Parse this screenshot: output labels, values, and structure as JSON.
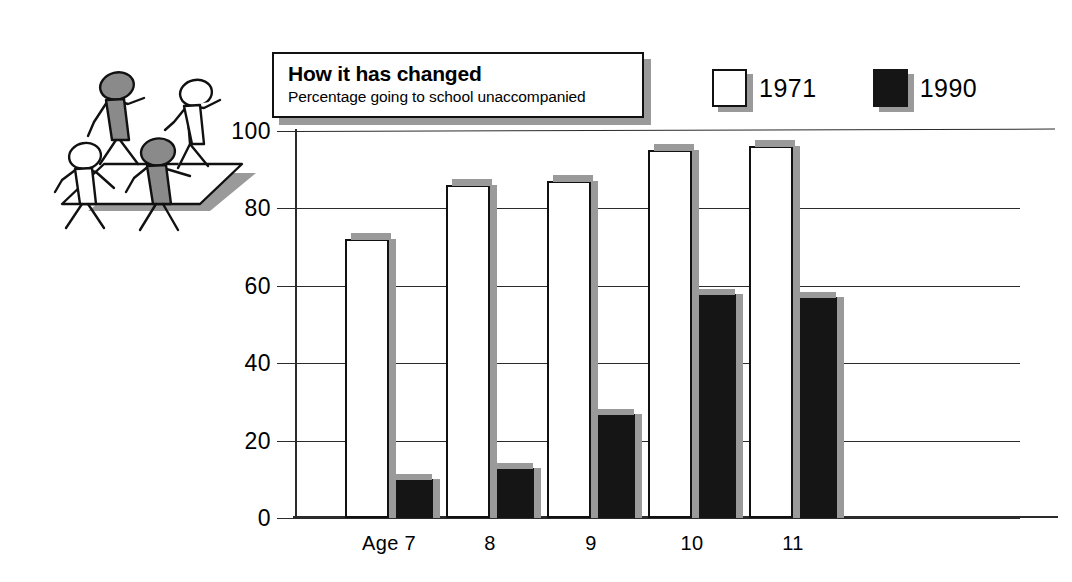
{
  "title": {
    "heading": "How it has changed",
    "subheading": "Percentage going to school unaccompanied"
  },
  "legend": {
    "position": "top-right",
    "items": [
      {
        "label": "1971",
        "swatch": "white-square",
        "color": "#ffffff"
      },
      {
        "label": "1990",
        "swatch": "black-square",
        "color": "#151515"
      }
    ]
  },
  "illustration": {
    "name": "children-walking-figures",
    "figure_count": 4,
    "colors": {
      "shaded": "#8a8a8a",
      "outline": "#111111",
      "shadow": "#9a9a9a"
    }
  },
  "axis": {
    "y_ticks": [
      "0",
      "20",
      "40",
      "60",
      "80",
      "100"
    ],
    "x_ticks": [
      "Age 7",
      "8",
      "9",
      "10",
      "11"
    ]
  },
  "chart_data": {
    "type": "bar",
    "title": "How it has changed",
    "subtitle": "Percentage going to school unaccompanied",
    "xlabel": "",
    "ylabel": "",
    "ylim": [
      0,
      100
    ],
    "yticks": [
      0,
      20,
      40,
      60,
      80,
      100
    ],
    "grid": true,
    "legend_position": "top-right",
    "categories": [
      "Age 7",
      "8",
      "9",
      "10",
      "11"
    ],
    "series": [
      {
        "name": "1971",
        "color": "#ffffff",
        "values": [
          72,
          86,
          87,
          95,
          96
        ]
      },
      {
        "name": "1990",
        "color": "#151515",
        "values": [
          10,
          13,
          27,
          58,
          57
        ]
      }
    ]
  }
}
